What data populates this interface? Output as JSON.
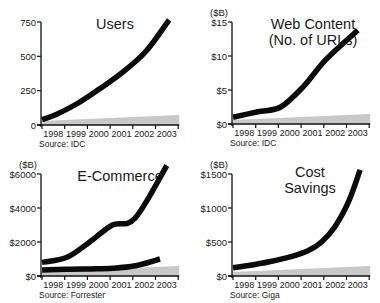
{
  "chart_data": [
    {
      "type": "line",
      "title": "Users",
      "unit_label": "",
      "source": "Source: IDC",
      "categories": [
        "1998",
        "1999",
        "2000",
        "2001",
        "2002",
        "2003"
      ],
      "yticks": [
        0,
        250,
        500,
        750
      ],
      "ytick_labels": [
        "0",
        "250",
        "500",
        "750"
      ],
      "ylim": [
        0,
        750
      ],
      "series": [
        {
          "name": "Users",
          "x": [
            1997.9,
            1998.5,
            1999.5,
            2000.5,
            2001.5,
            2002.5,
            2003.5
          ],
          "values": [
            40,
            75,
            160,
            270,
            390,
            540,
            765
          ]
        }
      ],
      "xlabel": "",
      "ylabel": "",
      "grid": false
    },
    {
      "type": "line",
      "title": "Web Content\n(No. of URLs)",
      "unit_label": "($B)",
      "source": "Source: IDC",
      "categories": [
        "1998",
        "1999",
        "2000",
        "2001",
        "2002",
        "2003"
      ],
      "yticks": [
        0,
        5,
        10,
        15
      ],
      "ytick_labels": [
        "$0",
        "$5",
        "$10",
        "$15"
      ],
      "ylim": [
        0,
        15
      ],
      "series": [
        {
          "name": "Web Content",
          "x": [
            1997.9,
            1999.0,
            2000.0,
            2001.0,
            2002.0,
            2003.4
          ],
          "values": [
            1.0,
            1.8,
            2.5,
            5.5,
            9.5,
            13.8
          ]
        }
      ],
      "xlabel": "",
      "ylabel": "($B)",
      "grid": false
    },
    {
      "type": "line",
      "title": "E-Commerce",
      "unit_label": "($B)",
      "source": "Source: Forrester",
      "categories": [
        "1998",
        "1999",
        "2000",
        "2001",
        "2002",
        "2003"
      ],
      "yticks": [
        0,
        2000,
        4000,
        6000
      ],
      "ytick_labels": [
        "$0",
        "$2000",
        "$4000",
        "$6000"
      ],
      "ylim": [
        0,
        6000
      ],
      "series": [
        {
          "name": "Upper series",
          "x": [
            1997.9,
            1999.0,
            2000.0,
            2001.0,
            2002.0,
            2003.4
          ],
          "values": [
            800,
            1100,
            2000,
            3000,
            3400,
            6500
          ]
        },
        {
          "name": "Lower series",
          "x": [
            1997.9,
            1999.0,
            2000.0,
            2001.0,
            2002.0,
            2003.1
          ],
          "values": [
            350,
            400,
            420,
            450,
            600,
            1000
          ]
        }
      ],
      "xlabel": "",
      "ylabel": "($B)",
      "grid": false
    },
    {
      "type": "line",
      "title": "Cost\nSavings",
      "unit_label": "($B)",
      "source": "Source: Giga",
      "categories": [
        "1998",
        "1999",
        "2000",
        "2001",
        "2002",
        "2003"
      ],
      "yticks": [
        0,
        500,
        1000,
        1500
      ],
      "ytick_labels": [
        "$0",
        "$500",
        "$1000",
        "$1500"
      ],
      "ylim": [
        0,
        1500
      ],
      "series": [
        {
          "name": "Cost Savings",
          "x": [
            1997.9,
            1998.5,
            1999.5,
            2000.5,
            2001.2,
            2001.8,
            2002.4,
            2003.0,
            2003.5
          ],
          "values": [
            120,
            150,
            210,
            290,
            370,
            500,
            730,
            1100,
            1560
          ]
        }
      ],
      "xlabel": "",
      "ylabel": "($B)",
      "grid": false
    }
  ],
  "panels": [
    {
      "left": 0,
      "top": 0,
      "axis_x": 41,
      "axis_top": 22,
      "axis_bottom": 125,
      "title_x": 70,
      "title_y": 16,
      "title_w": 90
    },
    {
      "left": 190,
      "top": 0,
      "axis_x": 42,
      "axis_top": 22,
      "axis_bottom": 124,
      "title_x": 68,
      "title_y": 16,
      "title_w": 110
    },
    {
      "left": 0,
      "top": 151,
      "axis_x": 41,
      "axis_top": 23,
      "axis_bottom": 125,
      "title_x": 65,
      "title_y": 17,
      "title_w": 110
    },
    {
      "left": 190,
      "top": 151,
      "axis_x": 42,
      "axis_top": 23,
      "axis_bottom": 125,
      "title_x": 80,
      "title_y": 13,
      "title_w": 80
    }
  ],
  "colors": {
    "line": "#0a0a0a",
    "axis": "#111111",
    "floor": "#c8c8c8",
    "text": "#1a1a1a"
  }
}
